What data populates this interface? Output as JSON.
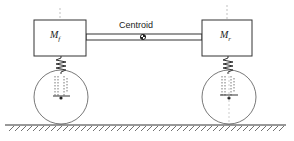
{
  "diagram": {
    "type": "half-car suspension model",
    "centroid_label": "Centroid",
    "front_mass": {
      "symbol": "M",
      "subscript": "f"
    },
    "rear_mass": {
      "symbol": "M",
      "subscript": "r"
    },
    "colors": {
      "line": "#333333",
      "background": "#ffffff"
    }
  }
}
